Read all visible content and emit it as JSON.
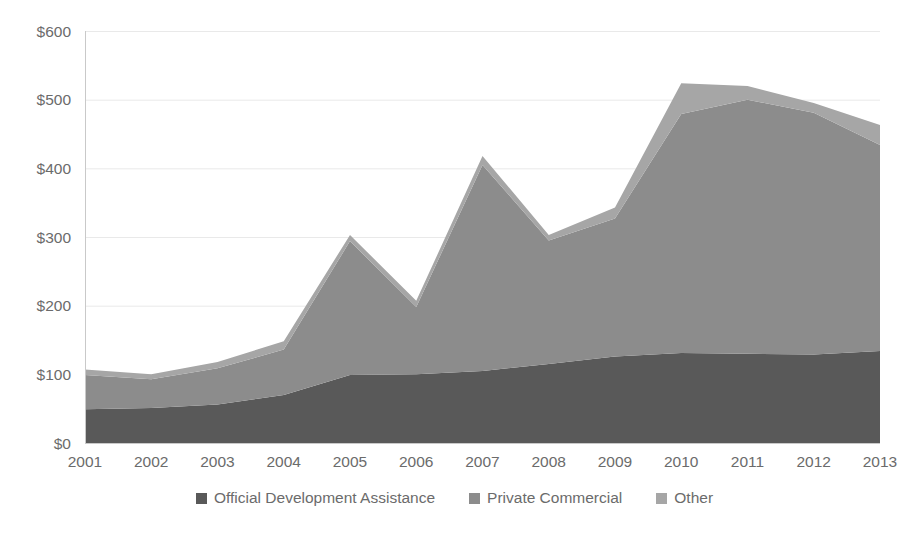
{
  "chart_data": {
    "type": "area",
    "stacked": true,
    "title": "",
    "subtitle": "",
    "xlabel": "",
    "ylabel": "",
    "categories": [
      "2001",
      "2002",
      "2003",
      "2004",
      "2005",
      "2006",
      "2007",
      "2008",
      "2009",
      "2010",
      "2011",
      "2012",
      "2013"
    ],
    "x_tick_labels": [
      "2001",
      "2002",
      "2003",
      "2004",
      "2005",
      "2006",
      "2007",
      "2008",
      "2009",
      "2010",
      "2011",
      "2012",
      "2013"
    ],
    "y_tick_labels": [
      "$0",
      "$100",
      "$200",
      "$300",
      "$400",
      "$500",
      "$600"
    ],
    "y_tick_values": [
      0,
      100,
      200,
      300,
      400,
      500,
      600
    ],
    "ylim": [
      0,
      600
    ],
    "grid": true,
    "legend_position": "bottom",
    "value_prefix": "$",
    "series": [
      {
        "name": "Official Development Assistance",
        "color": "#595959",
        "values": [
          49,
          51,
          56,
          70,
          99,
          100,
          105,
          115,
          126,
          131,
          130,
          129,
          134
        ]
      },
      {
        "name": "Private Commercial",
        "color": "#8c8c8c",
        "values": [
          50,
          42,
          53,
          66,
          195,
          98,
          300,
          180,
          201,
          348,
          370,
          352,
          300
        ]
      },
      {
        "name": "Other",
        "color": "#a6a6a6",
        "values": [
          8,
          7,
          9,
          12,
          9,
          9,
          13,
          8,
          16,
          45,
          20,
          14,
          29
        ]
      }
    ],
    "totals": [
      107,
      100,
      118,
      148,
      303,
      207,
      418,
      303,
      343,
      524,
      520,
      495,
      463
    ]
  },
  "legend": {
    "items": [
      {
        "label": "Official Development Assistance",
        "color": "#595959"
      },
      {
        "label": "Private Commercial",
        "color": "#8c8c8c"
      },
      {
        "label": "Other",
        "color": "#a6a6a6"
      }
    ]
  },
  "colors": {
    "background": "#ffffff",
    "grid": "#e9e9e9",
    "axis": "#c9c9c9",
    "tick_text": "#6b6b6b",
    "series_oda": "#595959",
    "series_private": "#8c8c8c",
    "series_other": "#a6a6a6"
  }
}
